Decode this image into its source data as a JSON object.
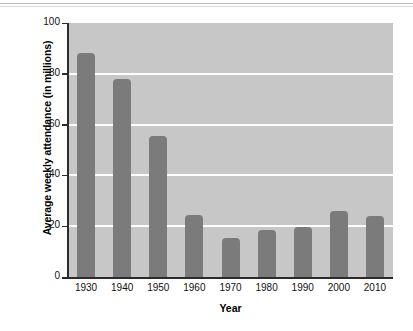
{
  "chart_data": {
    "type": "bar",
    "title": "",
    "xlabel": "Year",
    "ylabel": "Average weekly attendance (in millions)",
    "categories": [
      "1930",
      "1940",
      "1950",
      "1960",
      "1970",
      "1980",
      "1990",
      "2000",
      "2010"
    ],
    "values": [
      88,
      78,
      55.5,
      24.5,
      15.5,
      18.5,
      19.5,
      26,
      24
    ],
    "ylim": [
      0,
      100
    ],
    "yticks": [
      0,
      20,
      40,
      60,
      80,
      100
    ],
    "ytick_labels": [
      "0",
      "20",
      "40",
      "60",
      "80",
      "100"
    ],
    "gridlines": [
      20,
      40,
      60,
      80
    ],
    "grid": true,
    "legend": null,
    "colors": {
      "bar": "#7b7b7b",
      "plot_background": "#c7c7c7",
      "gridline": "#ffffff",
      "axis": "#2b2b2b",
      "page_background": "#ffffff",
      "text": "#111111"
    }
  }
}
